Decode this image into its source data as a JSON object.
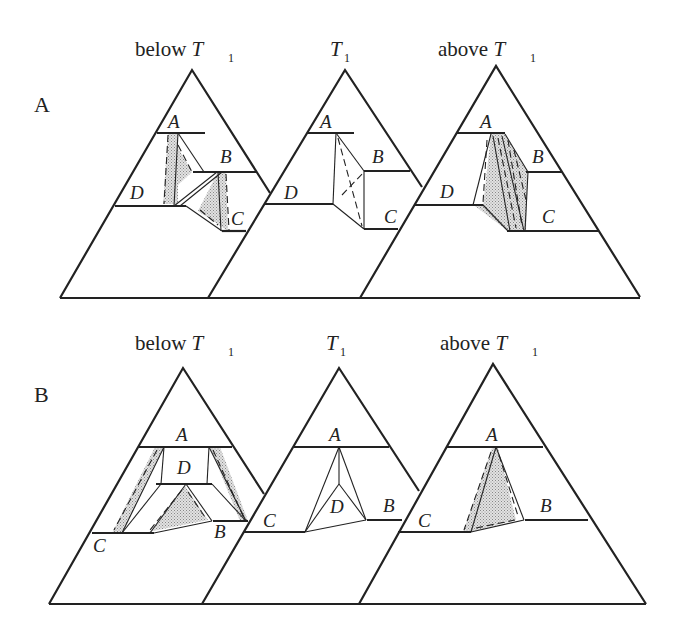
{
  "rows": [
    {
      "label": "A",
      "panels": [
        {
          "title": "below",
          "temp_symbol": "T",
          "temp_sub": "1",
          "phases": {
            "A": "A",
            "B": "B",
            "C": "C",
            "D": "D"
          }
        },
        {
          "title": "",
          "temp_symbol": "T",
          "temp_sub": "1",
          "phases": {
            "A": "A",
            "B": "B",
            "C": "C",
            "D": "D"
          }
        },
        {
          "title": "above",
          "temp_symbol": "T",
          "temp_sub": "1",
          "phases": {
            "A": "A",
            "B": "B",
            "C": "C",
            "D": "D"
          }
        }
      ]
    },
    {
      "label": "B",
      "panels": [
        {
          "title": "below",
          "temp_symbol": "T",
          "temp_sub": "1",
          "phases": {
            "A": "A",
            "B": "B",
            "C": "C",
            "D": "D"
          }
        },
        {
          "title": "",
          "temp_symbol": "T",
          "temp_sub": "1",
          "phases": {
            "A": "A",
            "B": "B",
            "C": "C",
            "D": "D"
          }
        },
        {
          "title": "above",
          "temp_symbol": "T",
          "temp_sub": "1",
          "phases": {
            "A": "A",
            "B": "B",
            "C": "C",
            "D": "D"
          }
        }
      ]
    }
  ],
  "colors": {
    "line": "#222222",
    "shade": "#c8c8c8",
    "background": "#ffffff"
  }
}
